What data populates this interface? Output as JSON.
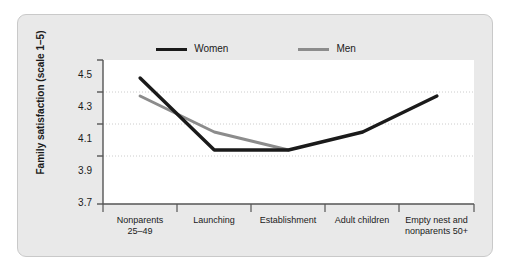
{
  "chart_data": {
    "type": "line",
    "title": "",
    "xlabel": "",
    "ylabel": "Family satisfaction (scale 1–5)",
    "ylim": [
      3.7,
      4.5
    ],
    "yticks": [
      "3.7",
      "3.9",
      "4.1",
      "4.3",
      "4.5"
    ],
    "ytick_values": [
      3.7,
      3.9,
      4.1,
      4.3,
      4.5
    ],
    "grid": true,
    "legend_position": "top-center",
    "categories": [
      "Nonparents 25–49",
      "Launching",
      "Establishment",
      "Adult children",
      "Empty nest and nonparents 50+"
    ],
    "category_lines": [
      [
        "Nonparents",
        "25–49"
      ],
      [
        "Launching"
      ],
      [
        "Establishment"
      ],
      [
        "Adult children"
      ],
      [
        "Empty nest and",
        "nonparents 50+"
      ]
    ],
    "series": [
      {
        "name": "Women",
        "color": "#1a1a1a",
        "values": [
          4.4,
          4.0,
          4.0,
          4.1,
          4.3
        ]
      },
      {
        "name": "Men",
        "color": "#8c8c8c",
        "values": [
          4.3,
          4.1,
          4.0,
          null,
          null
        ]
      }
    ]
  },
  "colors": {
    "panel_background": "#e9e9e9",
    "plot_background": "#ffffff",
    "axis": "#555555",
    "grid": "#cccccc",
    "women": "#1a1a1a",
    "men": "#8c8c8c"
  }
}
